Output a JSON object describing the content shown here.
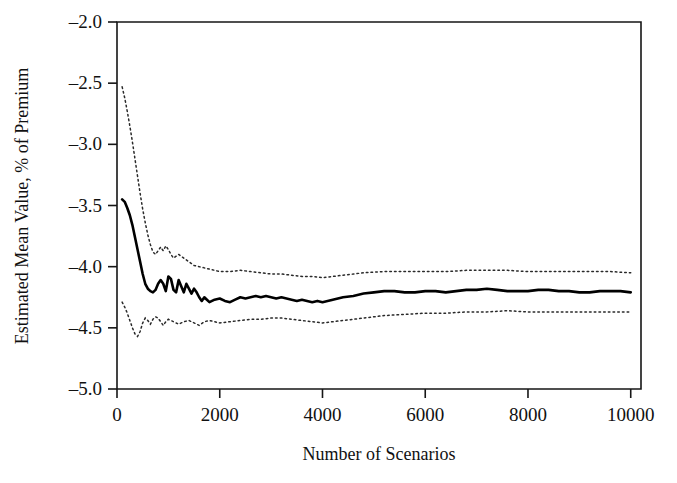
{
  "figure": {
    "background_color": "#ffffff",
    "frame_color": "#161616"
  },
  "axis": {
    "x_title": "Number of Scenarios",
    "y_title": "Estimated Mean Value, % of Premium",
    "x_ticks": [
      "0",
      "2000",
      "4000",
      "6000",
      "8000",
      "10000"
    ],
    "y_ticks": [
      "–2.0",
      "–2.5",
      "–3.0",
      "–3.5",
      "–4.0",
      "–4.5",
      "–5.0"
    ]
  },
  "chart_data": {
    "type": "line",
    "title": "",
    "xlabel": "Number of Scenarios",
    "ylabel": "Estimated Mean Value, % of Premium",
    "xlim": [
      0,
      10200
    ],
    "ylim": [
      -5.0,
      -2.0
    ],
    "xticks": [
      0,
      2000,
      4000,
      6000,
      8000,
      10000
    ],
    "yticks": [
      -2.0,
      -2.5,
      -3.0,
      -3.5,
      -4.0,
      -4.5,
      -5.0
    ],
    "grid": false,
    "legend": null,
    "series": [
      {
        "name": "Estimated mean",
        "style": "solid",
        "color": "#000000",
        "x": [
          100,
          150,
          200,
          250,
          300,
          350,
          400,
          450,
          500,
          550,
          600,
          650,
          700,
          750,
          800,
          850,
          900,
          950,
          1000,
          1050,
          1100,
          1150,
          1200,
          1250,
          1300,
          1350,
          1400,
          1450,
          1500,
          1550,
          1600,
          1650,
          1700,
          1750,
          1800,
          1900,
          2000,
          2100,
          2200,
          2300,
          2400,
          2500,
          2600,
          2700,
          2800,
          2900,
          3000,
          3100,
          3200,
          3300,
          3400,
          3500,
          3600,
          3700,
          3800,
          3900,
          4000,
          4200,
          4400,
          4600,
          4800,
          5000,
          5200,
          5400,
          5600,
          5800,
          6000,
          6200,
          6400,
          6600,
          6800,
          7000,
          7200,
          7400,
          7600,
          7800,
          8000,
          8200,
          8400,
          8600,
          8800,
          9000,
          9200,
          9400,
          9600,
          9800,
          10000
        ],
        "y": [
          -3.45,
          -3.47,
          -3.52,
          -3.58,
          -3.66,
          -3.76,
          -3.86,
          -3.96,
          -4.06,
          -4.14,
          -4.18,
          -4.2,
          -4.21,
          -4.19,
          -4.14,
          -4.11,
          -4.14,
          -4.2,
          -4.08,
          -4.1,
          -4.19,
          -4.21,
          -4.11,
          -4.16,
          -4.21,
          -4.14,
          -4.18,
          -4.22,
          -4.18,
          -4.21,
          -4.25,
          -4.28,
          -4.25,
          -4.27,
          -4.29,
          -4.27,
          -4.26,
          -4.28,
          -4.29,
          -4.27,
          -4.25,
          -4.26,
          -4.25,
          -4.24,
          -4.25,
          -4.24,
          -4.25,
          -4.26,
          -4.25,
          -4.26,
          -4.27,
          -4.28,
          -4.27,
          -4.28,
          -4.29,
          -4.28,
          -4.29,
          -4.27,
          -4.25,
          -4.24,
          -4.22,
          -4.21,
          -4.2,
          -4.2,
          -4.21,
          -4.21,
          -4.2,
          -4.2,
          -4.21,
          -4.2,
          -4.19,
          -4.19,
          -4.18,
          -4.19,
          -4.2,
          -4.2,
          -4.2,
          -4.19,
          -4.19,
          -4.2,
          -4.2,
          -4.21,
          -4.21,
          -4.2,
          -4.2,
          -4.2,
          -4.21
        ]
      },
      {
        "name": "Upper confidence bound",
        "style": "dotted",
        "color": "#2a2a2a",
        "x": [
          100,
          150,
          200,
          250,
          300,
          350,
          400,
          450,
          500,
          550,
          600,
          650,
          700,
          750,
          800,
          850,
          900,
          950,
          1000,
          1050,
          1100,
          1200,
          1300,
          1400,
          1500,
          1600,
          1700,
          1800,
          1900,
          2000,
          2200,
          2400,
          2600,
          2800,
          3000,
          3200,
          3400,
          3600,
          3800,
          4000,
          4400,
          4800,
          5200,
          5600,
          6000,
          6400,
          6800,
          7200,
          7600,
          8000,
          8400,
          8800,
          9200,
          9600,
          10000
        ],
        "y": [
          -2.53,
          -2.62,
          -2.73,
          -2.85,
          -2.98,
          -3.12,
          -3.26,
          -3.4,
          -3.53,
          -3.64,
          -3.74,
          -3.82,
          -3.88,
          -3.9,
          -3.87,
          -3.84,
          -3.87,
          -3.83,
          -3.86,
          -3.9,
          -3.93,
          -3.9,
          -3.93,
          -3.96,
          -3.99,
          -4.0,
          -4.01,
          -4.02,
          -4.03,
          -4.04,
          -4.04,
          -4.03,
          -4.04,
          -4.05,
          -4.06,
          -4.06,
          -4.07,
          -4.08,
          -4.08,
          -4.09,
          -4.07,
          -4.05,
          -4.04,
          -4.04,
          -4.04,
          -4.04,
          -4.03,
          -4.03,
          -4.03,
          -4.04,
          -4.04,
          -4.04,
          -4.04,
          -4.04,
          -4.05
        ]
      },
      {
        "name": "Lower confidence bound",
        "style": "dotted",
        "color": "#2a2a2a",
        "x": [
          100,
          150,
          200,
          250,
          300,
          350,
          400,
          450,
          500,
          550,
          600,
          650,
          700,
          750,
          800,
          850,
          900,
          950,
          1000,
          1100,
          1200,
          1300,
          1400,
          1500,
          1600,
          1700,
          1800,
          1900,
          2000,
          2200,
          2400,
          2600,
          2800,
          3000,
          3200,
          3400,
          3600,
          3800,
          4000,
          4400,
          4800,
          5200,
          5600,
          6000,
          6400,
          6800,
          7200,
          7600,
          8000,
          8400,
          8800,
          9200,
          9600,
          10000
        ],
        "y": [
          -4.29,
          -4.33,
          -4.38,
          -4.44,
          -4.5,
          -4.55,
          -4.57,
          -4.53,
          -4.46,
          -4.42,
          -4.44,
          -4.47,
          -4.43,
          -4.41,
          -4.42,
          -4.45,
          -4.48,
          -4.45,
          -4.43,
          -4.45,
          -4.47,
          -4.45,
          -4.44,
          -4.46,
          -4.48,
          -4.45,
          -4.44,
          -4.45,
          -4.46,
          -4.45,
          -4.44,
          -4.43,
          -4.43,
          -4.42,
          -4.42,
          -4.43,
          -4.44,
          -4.45,
          -4.46,
          -4.44,
          -4.42,
          -4.4,
          -4.39,
          -4.38,
          -4.38,
          -4.37,
          -4.37,
          -4.36,
          -4.37,
          -4.37,
          -4.37,
          -4.37,
          -4.37,
          -4.37
        ]
      }
    ]
  }
}
